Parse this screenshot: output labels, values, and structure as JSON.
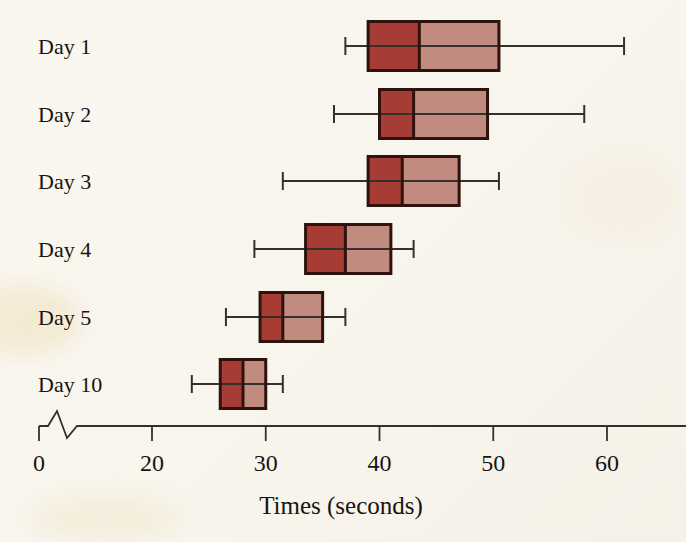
{
  "figure": {
    "background": "#f8f5ed",
    "text_color": "#171411"
  },
  "chart_data": {
    "type": "boxplot",
    "orientation": "horizontal",
    "title": "",
    "xlabel": "Times (seconds)",
    "categories": [
      "Day 1",
      "Day 2",
      "Day 3",
      "Day 4",
      "Day 5",
      "Day 10"
    ],
    "series": [
      {
        "name": "Day 1",
        "min": 37,
        "q1": 39,
        "median": 43.5,
        "q3": 50.5,
        "max": 61.5
      },
      {
        "name": "Day 2",
        "min": 36,
        "q1": 40,
        "median": 43,
        "q3": 49.5,
        "max": 58
      },
      {
        "name": "Day 3",
        "min": 31.5,
        "q1": 39,
        "median": 42,
        "q3": 47,
        "max": 50.5
      },
      {
        "name": "Day 4",
        "min": 29,
        "q1": 33.5,
        "median": 37,
        "q3": 41,
        "max": 43
      },
      {
        "name": "Day 5",
        "min": 26.5,
        "q1": 29.5,
        "median": 31.5,
        "q3": 35,
        "max": 37
      },
      {
        "name": "Day 10",
        "min": 23.5,
        "q1": 26,
        "median": 28,
        "q3": 30,
        "max": 31.5
      }
    ],
    "x_ticks": [
      0,
      20,
      30,
      40,
      50,
      60
    ],
    "axis_break_between": [
      0,
      20
    ],
    "xlim_linear": [
      20,
      67
    ],
    "grid": false,
    "legend": false,
    "colors": {
      "box_lower_fill": "#a63c34",
      "box_upper_fill": "#c28b7f",
      "box_border": "#2e120d",
      "line": "#35302c"
    }
  }
}
